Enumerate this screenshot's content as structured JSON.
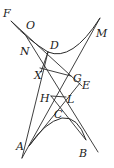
{
  "diagram": {
    "type": "geometry",
    "points": {
      "F": {
        "label": "F",
        "x": 11,
        "y": 21,
        "lx": 3,
        "ly": 17
      },
      "O": {
        "label": "O",
        "x": 30,
        "y": 31,
        "lx": 26,
        "ly": 29
      },
      "D": {
        "label": "D",
        "x": 48,
        "y": 52,
        "lx": 50,
        "ly": 49
      },
      "M": {
        "label": "M",
        "x": 100,
        "y": 18,
        "lx": 96,
        "ly": 37
      },
      "N": {
        "label": "N",
        "x": 30,
        "y": 44,
        "lx": 20,
        "ly": 55
      },
      "X": {
        "label": "X",
        "x": 44,
        "y": 70,
        "lx": 34,
        "ly": 79
      },
      "G": {
        "label": "G",
        "x": 71,
        "y": 76,
        "lx": 73,
        "ly": 82
      },
      "E": {
        "label": "E",
        "x": 80,
        "y": 83,
        "lx": 82,
        "ly": 89
      },
      "H": {
        "label": "H",
        "x": 51,
        "y": 96,
        "lx": 40,
        "ly": 102
      },
      "L": {
        "label": "L",
        "x": 66,
        "y": 97,
        "lx": 67,
        "ly": 103
      },
      "C": {
        "label": "C",
        "x": 59,
        "y": 108,
        "lx": 54,
        "ly": 118
      },
      "A": {
        "label": "A",
        "x": 29,
        "y": 146,
        "lx": 16,
        "ly": 150
      },
      "B": {
        "label": "B",
        "x": 86,
        "y": 140,
        "lx": 79,
        "ly": 157
      }
    },
    "label_order": [
      "F",
      "O",
      "D",
      "M",
      "N",
      "X",
      "G",
      "E",
      "H",
      "L",
      "C",
      "A",
      "B"
    ],
    "colors": {
      "ink": "#2a2a2a",
      "background": "#ffffff"
    }
  }
}
